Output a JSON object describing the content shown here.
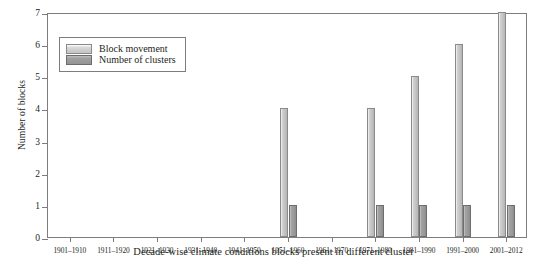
{
  "chart_data": {
    "type": "bar",
    "title": "",
    "xlabel": "Decade-wise climate conditions blocks present in different cluster",
    "ylabel": "Number of blocks",
    "categories": [
      "1901–1910",
      "1911–1920",
      "1921–1930",
      "1931–1940",
      "1941–1950",
      "1951–1960",
      "1961–1970",
      "1971–1980",
      "1981–1990",
      "1991–2000",
      "2001–2012"
    ],
    "series": [
      {
        "name": "Block movement",
        "values": [
          0,
          0,
          0,
          0,
          0,
          4,
          0,
          4,
          5,
          6,
          7
        ],
        "color": "#c4c4c4"
      },
      {
        "name": "Number of clusters",
        "values": [
          0,
          0,
          0,
          0,
          0,
          1,
          0,
          1,
          1,
          1,
          1
        ],
        "color": "#9a9a9a"
      }
    ],
    "ylim": [
      0,
      7
    ],
    "yticks": [
      0,
      1,
      2,
      3,
      4,
      5,
      6,
      7
    ],
    "ytick_labels": [
      "0",
      "1",
      "2",
      "3",
      "4",
      "5",
      "6",
      "7"
    ],
    "grid": false,
    "legend_position": "upper-left"
  },
  "legend": {
    "items": [
      {
        "label": "Block movement",
        "swatch": "light-gray-swatch"
      },
      {
        "label": "Number of clusters",
        "swatch": "dark-gray-swatch"
      }
    ]
  }
}
